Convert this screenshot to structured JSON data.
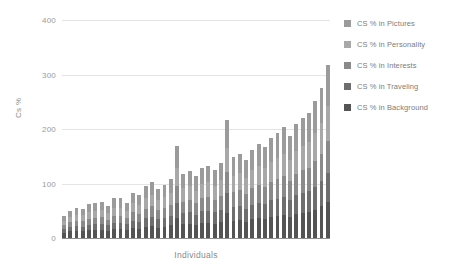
{
  "chart_data": {
    "type": "bar",
    "subtype": "stacked-bar",
    "title": "",
    "xlabel": "Individuals",
    "ylabel": "Cs %",
    "ylim": [
      0,
      400
    ],
    "yticks": [
      0,
      100,
      200,
      300,
      400
    ],
    "grid": true,
    "legend_position": "right",
    "categories": [
      "1",
      "2",
      "3",
      "4",
      "5",
      "6",
      "7",
      "8",
      "9",
      "10",
      "11",
      "12",
      "13",
      "14",
      "15",
      "16",
      "17",
      "18",
      "19",
      "20",
      "21",
      "22",
      "23",
      "24",
      "25",
      "26",
      "27",
      "28",
      "29",
      "30",
      "31",
      "32",
      "33",
      "34",
      "35",
      "36",
      "37",
      "38",
      "39",
      "40",
      "41",
      "42",
      "43"
    ],
    "series": [
      {
        "name": "CS % in Background",
        "color": "#545454",
        "values": [
          10,
          12,
          13,
          12,
          14,
          14,
          15,
          13,
          16,
          16,
          14,
          18,
          17,
          20,
          22,
          19,
          21,
          23,
          36,
          25,
          26,
          24,
          27,
          28,
          26,
          29,
          46,
          31,
          33,
          30,
          34,
          36,
          35,
          38,
          40,
          42,
          39,
          44,
          46,
          48,
          52,
          58,
          66
        ]
      },
      {
        "name": "CS % in Traveling",
        "color": "#6e6e6e",
        "values": [
          6,
          8,
          9,
          9,
          10,
          11,
          11,
          10,
          12,
          12,
          11,
          14,
          13,
          16,
          17,
          15,
          16,
          18,
          28,
          20,
          21,
          19,
          22,
          22,
          21,
          23,
          36,
          25,
          26,
          24,
          27,
          29,
          28,
          31,
          32,
          34,
          31,
          35,
          37,
          38,
          42,
          46,
          53
        ]
      },
      {
        "name": "CS % in Interests",
        "color": "#8a8a8a",
        "values": [
          7,
          9,
          10,
          10,
          11,
          12,
          12,
          11,
          13,
          13,
          12,
          15,
          15,
          18,
          19,
          17,
          18,
          20,
          31,
          22,
          23,
          21,
          24,
          25,
          23,
          26,
          40,
          28,
          29,
          27,
          30,
          32,
          31,
          34,
          36,
          38,
          35,
          39,
          41,
          43,
          47,
          51,
          59
        ]
      },
      {
        "name": "CS % in Personality",
        "color": "#a8a8a8",
        "values": [
          8,
          10,
          11,
          11,
          13,
          13,
          14,
          12,
          15,
          15,
          13,
          17,
          16,
          19,
          21,
          18,
          20,
          22,
          34,
          24,
          25,
          23,
          26,
          27,
          25,
          28,
          44,
          30,
          31,
          29,
          33,
          35,
          34,
          37,
          39,
          41,
          38,
          42,
          45,
          47,
          51,
          56,
          64
        ]
      },
      {
        "name": "CS % in Pictures",
        "color": "#9b9b9b",
        "values": [
          9,
          11,
          12,
          12,
          14,
          15,
          15,
          13,
          17,
          17,
          15,
          19,
          18,
          22,
          24,
          21,
          23,
          25,
          39,
          27,
          28,
          26,
          30,
          31,
          29,
          32,
          50,
          34,
          36,
          33,
          38,
          40,
          39,
          43,
          45,
          48,
          44,
          49,
          52,
          54,
          59,
          65,
          75
        ]
      }
    ],
    "totals": [
      40,
      50,
      55,
      54,
      62,
      65,
      67,
      59,
      73,
      73,
      65,
      83,
      79,
      95,
      103,
      90,
      98,
      108,
      168,
      118,
      123,
      113,
      129,
      133,
      124,
      138,
      216,
      148,
      155,
      143,
      162,
      172,
      167,
      183,
      192,
      203,
      187,
      209,
      221,
      230,
      251,
      276,
      317
    ],
    "legend": [
      {
        "label": "CS % in Pictures",
        "color": "#9b9b9b"
      },
      {
        "label": "CS % in Personality",
        "color": "#a8a8a8"
      },
      {
        "label": "CS % in Interests",
        "color": "#8a8a8a"
      },
      {
        "label": "CS % in Traveling",
        "color": "#6e6e6e"
      },
      {
        "label": "CS % in Background",
        "color": "#545454"
      }
    ]
  },
  "axes": {
    "y_tick_labels": [
      "400",
      "300",
      "200",
      "100",
      "0"
    ],
    "y_title": "Cs %",
    "x_title": "Individuals"
  }
}
